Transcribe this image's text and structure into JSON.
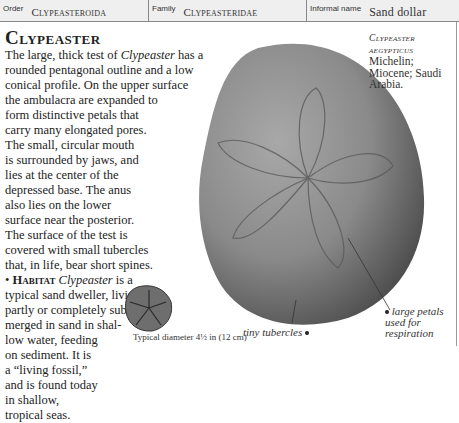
{
  "header": {
    "order_label": "Order",
    "order_value": "Clypeasteroida",
    "family_label": "Family",
    "family_value": "Clypeasteridae",
    "informal_label": "Informal name",
    "informal_value": "Sand dollar"
  },
  "entry": {
    "title": "Clypeaster",
    "description_lines": [
      "The large, thick test of ",
      "Clypeaster",
      " has a",
      "rounded pentagonal outline and a low",
      "conical profile. On the upper surface",
      "the ambulacra are expanded to",
      "form distinctive petals that",
      "carry many elongated pores.",
      "The small, circular mouth",
      "is surrounded by jaws, and",
      "lies at the center of the",
      "depressed base. The anus",
      "also lies on the lower",
      "surface near the posterior.",
      "The surface of the test is",
      "covered with small tubercles",
      "that, in life, bear short spines."
    ],
    "habitat_label": "Habitat",
    "habitat_genus": "Clypeaster",
    "habitat_lines": [
      " is a",
      "typical sand dweller, living",
      "partly or completely sub-",
      "merged in sand in shal-",
      "low water, feeding",
      "on sediment. It is",
      "a “living fossil,”",
      "and is found today",
      "in shallow,",
      "tropical seas."
    ]
  },
  "specimen": {
    "genus": "Clypeaster",
    "species": "aegypticus",
    "author": "Michelin;",
    "age_location_1": "Miocene; Saudi",
    "age_location_2": "Arabia."
  },
  "captions": {
    "diameter": "Typical diameter 4½ in (12 cm)",
    "tubercles": "tiny tubercles",
    "petals_1": "large petals",
    "petals_2": "used for",
    "petals_3": "respiration"
  },
  "icons": {
    "bullet": "bullet-icon",
    "main_image": "sand-dollar-fossil-image",
    "thumb_image": "sand-dollar-underside-image"
  }
}
